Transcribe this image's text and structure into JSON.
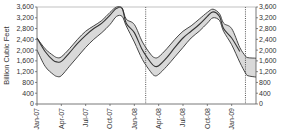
{
  "chart_data": {
    "type": "area",
    "title": "",
    "xlabel": "",
    "ylabel": "Billion Cubic Feet",
    "ylabel_right": "",
    "ylim": [
      0,
      3600
    ],
    "yticks": [
      0,
      400,
      800,
      1200,
      1600,
      2000,
      2400,
      2800,
      3200,
      3600
    ],
    "ytick_labels": [
      "0",
      "400",
      "800",
      "1,200",
      "1,600",
      "2,000",
      "2,400",
      "2,800",
      "3,200",
      "3,600"
    ],
    "xlim_months": [
      0,
      27
    ],
    "xticks_months": [
      0,
      3,
      6,
      9,
      12,
      15,
      18,
      21,
      24
    ],
    "xtick_labels": [
      "Jan-07",
      "Apr-07",
      "Jul-07",
      "Oct-07",
      "Jan-08",
      "Apr-08",
      "Jul-08",
      "Oct-08",
      "Jan-09"
    ],
    "grid": false,
    "legend": "none",
    "vertical_markers_months": [
      13.4,
      25.7
    ],
    "x_months": [
      0,
      1,
      2,
      2.5,
      3,
      4,
      5,
      6,
      7,
      8,
      9,
      9.8,
      10.5,
      11,
      12,
      13,
      14,
      14.5,
      15,
      16,
      17,
      18,
      19,
      20,
      21,
      21.7,
      22.5,
      23,
      24,
      25,
      25.7,
      26,
      27
    ],
    "series": [
      {
        "name": "Upper range",
        "role": "band-upper",
        "values": [
          2450,
          2050,
          1800,
          1720,
          1750,
          2050,
          2400,
          2700,
          2900,
          3100,
          3400,
          3600,
          3550,
          3150,
          2950,
          2300,
          1850,
          1720,
          1750,
          2050,
          2400,
          2700,
          2900,
          3150,
          3400,
          3520,
          3350,
          3000,
          2800,
          2100,
          1780,
          1720,
          1700
        ]
      },
      {
        "name": "Actual storage",
        "role": "line",
        "values": [
          2450,
          1950,
          1620,
          1560,
          1580,
          1900,
          2250,
          2550,
          2800,
          3000,
          3300,
          3550,
          3550,
          3000,
          2650,
          2000,
          1550,
          1400,
          1420,
          1720,
          2100,
          2450,
          2700,
          2950,
          3250,
          3420,
          3250,
          2800,
          2450,
          1950,
          null,
          null,
          null
        ]
      },
      {
        "name": "Lower range",
        "role": "band-lower",
        "values": [
          2000,
          1400,
          1100,
          1020,
          1050,
          1400,
          1750,
          2100,
          2400,
          2650,
          2950,
          3250,
          3250,
          2900,
          2300,
          1650,
          1200,
          1050,
          1100,
          1400,
          1750,
          2100,
          2450,
          2700,
          3000,
          3200,
          3100,
          2700,
          2200,
          1550,
          1150,
          1050,
          1000
        ]
      }
    ],
    "colors": {
      "band_fill": "#d9d9d9",
      "line": "#333333",
      "axis": "#555555",
      "marker": "#444444"
    }
  }
}
